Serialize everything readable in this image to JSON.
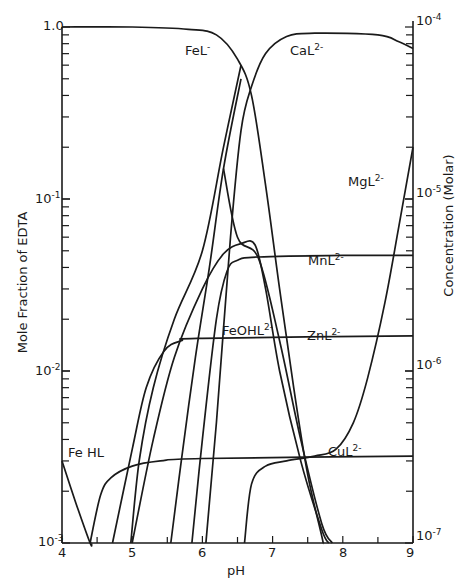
{
  "chart_data": {
    "type": "line",
    "title": "",
    "xlabel": "pH",
    "ylabel": "Mole Fraction of EDTA",
    "ylabel_right": "Concentration (Molar)",
    "xlim": [
      4,
      9
    ],
    "ylim": [
      0.001,
      1.0
    ],
    "yscale": "log",
    "ylim_right": [
      1e-07,
      0.0001
    ],
    "x_ticks": [
      "4",
      "5",
      "6",
      "7",
      "8",
      "9"
    ],
    "y_ticks_left": [
      "1.0",
      "10^-1",
      "10^-2",
      "10^-3"
    ],
    "y_ticks_right": [
      "10^-4",
      "10^-5",
      "10^-6",
      "10^-7"
    ],
    "grid": false,
    "legend": "inline labels",
    "series": [
      {
        "name": "FeL-",
        "label": "FeL",
        "sup": "-",
        "label_pos": [
          185,
          52
        ],
        "points": [
          [
            4.0,
            1.0
          ],
          [
            5.0,
            1.0
          ],
          [
            5.8,
            0.97
          ],
          [
            6.2,
            0.9
          ],
          [
            6.5,
            0.65
          ],
          [
            6.7,
            0.4
          ],
          [
            6.9,
            0.12
          ],
          [
            7.1,
            0.03
          ],
          [
            7.3,
            0.008
          ],
          [
            7.5,
            0.0025
          ],
          [
            7.7,
            0.0011
          ],
          [
            7.72,
            0.001
          ]
        ]
      },
      {
        "name": "CaL2-",
        "label": "CaL",
        "sup": "2-",
        "label_pos": [
          290,
          52
        ],
        "points": [
          [
            6.05,
            0.001
          ],
          [
            6.2,
            0.005
          ],
          [
            6.4,
            0.06
          ],
          [
            6.55,
            0.25
          ],
          [
            6.7,
            0.45
          ],
          [
            6.9,
            0.7
          ],
          [
            7.2,
            0.88
          ],
          [
            7.6,
            0.92
          ],
          [
            8.5,
            0.9
          ],
          [
            8.8,
            0.82
          ],
          [
            9.0,
            0.75
          ]
        ]
      },
      {
        "name": "MgL2-",
        "label": "MgL",
        "sup": "2-",
        "label_pos": [
          348,
          183
        ],
        "points": [
          [
            6.6,
            0.001
          ],
          [
            6.7,
            0.0022
          ],
          [
            6.9,
            0.0028
          ],
          [
            7.2,
            0.003
          ],
          [
            7.6,
            0.0032
          ],
          [
            7.9,
            0.0035
          ],
          [
            8.15,
            0.005
          ],
          [
            8.35,
            0.009
          ],
          [
            8.6,
            0.025
          ],
          [
            8.8,
            0.07
          ],
          [
            9.0,
            0.2
          ]
        ]
      },
      {
        "name": "MnL2-",
        "label": "MnL",
        "sup": "2-",
        "label_pos": [
          308,
          262
        ],
        "points": [
          [
            5.85,
            0.001
          ],
          [
            6.0,
            0.004
          ],
          [
            6.2,
            0.02
          ],
          [
            6.35,
            0.038
          ],
          [
            6.5,
            0.044
          ],
          [
            6.8,
            0.046
          ],
          [
            8.0,
            0.047
          ],
          [
            9.0,
            0.047
          ]
        ]
      },
      {
        "name": "FeOHL2-",
        "label": "FeOHL",
        "sup": "2-",
        "label_pos": [
          222,
          332
        ],
        "points": [
          [
            5.0,
            0.001
          ],
          [
            5.3,
            0.004
          ],
          [
            5.6,
            0.012
          ],
          [
            6.0,
            0.03
          ],
          [
            6.3,
            0.048
          ],
          [
            6.55,
            0.055
          ],
          [
            6.75,
            0.054
          ],
          [
            6.9,
            0.03
          ],
          [
            7.1,
            0.01
          ],
          [
            7.4,
            0.003
          ],
          [
            7.7,
            0.0012
          ],
          [
            7.8,
            0.001
          ]
        ]
      },
      {
        "name": "ZnL2-",
        "label": "ZnL",
        "sup": "2-",
        "label_pos": [
          307,
          337
        ],
        "points": [
          [
            4.72,
            0.001
          ],
          [
            5.0,
            0.0035
          ],
          [
            5.2,
            0.008
          ],
          [
            5.45,
            0.013
          ],
          [
            5.7,
            0.015
          ],
          [
            6.0,
            0.0155
          ],
          [
            9.0,
            0.016
          ]
        ]
      },
      {
        "name": "CuL2-",
        "label": "CuL",
        "sup": "2-",
        "label_pos": [
          328,
          453
        ],
        "points": [
          [
            4.4,
            0.001
          ],
          [
            4.55,
            0.0019
          ],
          [
            4.7,
            0.0024
          ],
          [
            5.0,
            0.0028
          ],
          [
            5.4,
            0.003
          ],
          [
            6.0,
            0.0031
          ],
          [
            9.0,
            0.0032
          ]
        ]
      },
      {
        "name": "FeHL",
        "label": "Fe HL",
        "sup": "",
        "label_pos": [
          68,
          455
        ],
        "points": [
          [
            4.0,
            0.003
          ],
          [
            4.2,
            0.0017
          ],
          [
            4.4,
            0.001
          ],
          [
            4.42,
            0.001
          ]
        ]
      },
      {
        "name": "line-5.0",
        "label": "",
        "sup": "",
        "points": [
          [
            4.98,
            0.001
          ],
          [
            5.1,
            0.003
          ],
          [
            5.3,
            0.008
          ],
          [
            5.6,
            0.02
          ],
          [
            6.0,
            0.05
          ],
          [
            6.3,
            0.2
          ],
          [
            6.55,
            0.6
          ]
        ]
      },
      {
        "name": "line-5.55",
        "label": "",
        "sup": "",
        "points": [
          [
            5.55,
            0.001
          ],
          [
            5.7,
            0.003
          ],
          [
            5.9,
            0.012
          ],
          [
            6.1,
            0.04
          ],
          [
            6.3,
            0.15
          ],
          [
            6.55,
            0.5
          ]
        ]
      },
      {
        "name": "steep-fall",
        "label": "",
        "sup": "",
        "points": [
          [
            6.3,
            0.15
          ],
          [
            6.5,
            0.06
          ],
          [
            6.8,
            0.045
          ],
          [
            7.1,
            0.015
          ],
          [
            7.4,
            0.004
          ],
          [
            7.7,
            0.0013
          ],
          [
            7.85,
            0.001
          ]
        ]
      }
    ]
  },
  "axes": {
    "x_title": "pH",
    "y_left_title": "Mole Fraction of EDTA",
    "y_right_title": "Concentration (Molar)",
    "y_left_labels": {
      "top": "1.0",
      "d1": "10",
      "d1_exp": "-1",
      "d2": "10",
      "d2_exp": "-2",
      "d3": "10",
      "d3_exp": "-3"
    },
    "y_right_labels": {
      "r4": "10",
      "r4_exp": "-4",
      "r5": "10",
      "r5_exp": "-5",
      "r6": "10",
      "r6_exp": "-6",
      "r7": "10",
      "r7_exp": "-7"
    },
    "x_labels": [
      "4",
      "5",
      "6",
      "7",
      "8",
      "9"
    ]
  },
  "colors": {
    "ink": "#1a1a1a",
    "background": "#ffffff"
  }
}
